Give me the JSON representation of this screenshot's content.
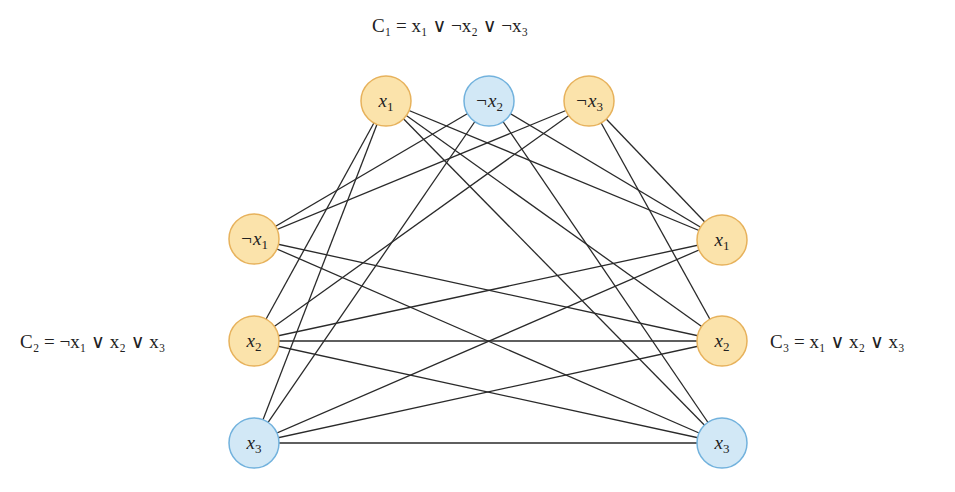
{
  "diagram": {
    "colors": {
      "orange_fill": "#fbe3ab",
      "orange_stroke": "#e7b25c",
      "blue_fill": "#d2e8f6",
      "blue_stroke": "#72b2dd",
      "edge": "#2a2a2a"
    },
    "clauses": [
      {
        "id": "C1",
        "label": "C₁ = x₁ ∨ ¬x₂ ∨ ¬x₃",
        "position": "top"
      },
      {
        "id": "C2",
        "label": "C₂ = ¬x₁ ∨ x₂ ∨ x₃",
        "position": "left"
      },
      {
        "id": "C3",
        "label": "C₃ = x₁ ∨ x₂ ∨ x₃",
        "position": "right"
      }
    ],
    "nodes": [
      {
        "id": "c1a",
        "clause": "C1",
        "neg": false,
        "var": "x",
        "sub": "1",
        "color": "orange",
        "cx": 386,
        "cy": 101
      },
      {
        "id": "c1b",
        "clause": "C1",
        "neg": true,
        "var": "x",
        "sub": "2",
        "color": "blue",
        "cx": 489,
        "cy": 101
      },
      {
        "id": "c1c",
        "clause": "C1",
        "neg": true,
        "var": "x",
        "sub": "3",
        "color": "orange",
        "cx": 589,
        "cy": 101
      },
      {
        "id": "c2a",
        "clause": "C2",
        "neg": true,
        "var": "x",
        "sub": "1",
        "color": "orange",
        "cx": 254,
        "cy": 239
      },
      {
        "id": "c2b",
        "clause": "C2",
        "neg": false,
        "var": "x",
        "sub": "2",
        "color": "orange",
        "cx": 254,
        "cy": 341
      },
      {
        "id": "c2c",
        "clause": "C2",
        "neg": false,
        "var": "x",
        "sub": "3",
        "color": "blue",
        "cx": 254,
        "cy": 443
      },
      {
        "id": "c3a",
        "clause": "C3",
        "neg": false,
        "var": "x",
        "sub": "1",
        "color": "orange",
        "cx": 722,
        "cy": 240
      },
      {
        "id": "c3b",
        "clause": "C3",
        "neg": false,
        "var": "x",
        "sub": "2",
        "color": "orange",
        "cx": 722,
        "cy": 341
      },
      {
        "id": "c3c",
        "clause": "C3",
        "neg": false,
        "var": "x",
        "sub": "3",
        "color": "blue",
        "cx": 722,
        "cy": 443
      }
    ],
    "edges": [
      [
        "c1a",
        "c2b"
      ],
      [
        "c1a",
        "c2c"
      ],
      [
        "c1b",
        "c2a"
      ],
      [
        "c1b",
        "c2c"
      ],
      [
        "c1c",
        "c2a"
      ],
      [
        "c1c",
        "c2b"
      ],
      [
        "c1a",
        "c3a"
      ],
      [
        "c1a",
        "c3b"
      ],
      [
        "c1a",
        "c3c"
      ],
      [
        "c1b",
        "c3a"
      ],
      [
        "c1b",
        "c3c"
      ],
      [
        "c1c",
        "c3a"
      ],
      [
        "c1c",
        "c3b"
      ],
      [
        "c2a",
        "c3b"
      ],
      [
        "c2a",
        "c3c"
      ],
      [
        "c2b",
        "c3a"
      ],
      [
        "c2b",
        "c3b"
      ],
      [
        "c2b",
        "c3c"
      ],
      [
        "c2c",
        "c3a"
      ],
      [
        "c2c",
        "c3b"
      ],
      [
        "c2c",
        "c3c"
      ]
    ],
    "node_radius": 25
  }
}
